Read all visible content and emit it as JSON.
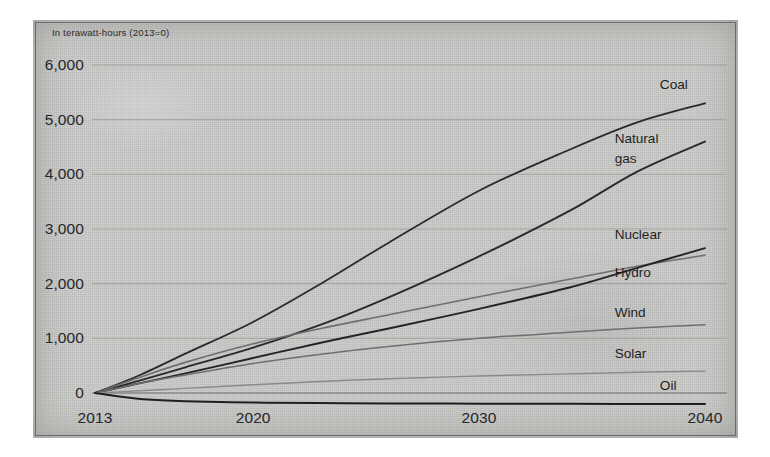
{
  "figure": {
    "subtitle": "In terawatt-hours (2013=0)",
    "background_color": "#c9c9c7",
    "paper_color": "#ffffff"
  },
  "chart_data": {
    "type": "line",
    "title": "",
    "subtitle": "In terawatt-hours (2013=0)",
    "xlabel": "",
    "ylabel": "",
    "xlim": [
      2013,
      2040
    ],
    "ylim": [
      -400,
      6400
    ],
    "grid": true,
    "gridlines_y": [
      0,
      1000,
      2000,
      3000,
      4000,
      5000,
      6000
    ],
    "legend_position": "right-inline-labels",
    "x_tick_labels": [
      "2013",
      "2020",
      "2030",
      "2040"
    ],
    "x_ticks": [
      2013,
      2020,
      2030,
      2040
    ],
    "y_tick_labels": [
      "0",
      "1,000",
      "2,000",
      "3,000",
      "4,000",
      "5,000",
      "6,000"
    ],
    "y_ticks": [
      0,
      1000,
      2000,
      3000,
      4000,
      5000,
      6000
    ],
    "x": [
      2013,
      2015,
      2017,
      2020,
      2023,
      2026,
      2030,
      2034,
      2037,
      2040
    ],
    "series": [
      {
        "name": "Coal",
        "color": "#2a2a2e",
        "width": 1.8,
        "values": [
          0,
          330,
          720,
          1300,
          2000,
          2750,
          3700,
          4450,
          4950,
          5300
        ]
      },
      {
        "name": "Natural gas",
        "color": "#2a2a2e",
        "width": 1.9,
        "values": [
          0,
          230,
          470,
          830,
          1250,
          1750,
          2500,
          3330,
          4050,
          4600
        ]
      },
      {
        "name": "Nuclear",
        "color": "#6f6f70",
        "width": 1.6,
        "values": [
          0,
          290,
          560,
          900,
          1180,
          1430,
          1760,
          2080,
          2320,
          2520
        ]
      },
      {
        "name": "Hydro",
        "color": "#242428",
        "width": 1.9,
        "values": [
          0,
          180,
          360,
          640,
          920,
          1180,
          1540,
          1930,
          2290,
          2650
        ]
      },
      {
        "name": "Wind",
        "color": "#6f6f70",
        "width": 1.5,
        "values": [
          0,
          180,
          330,
          540,
          710,
          850,
          1000,
          1110,
          1190,
          1250
        ]
      },
      {
        "name": "Solar",
        "color": "#8a8a8b",
        "width": 1.4,
        "values": [
          0,
          40,
          85,
          150,
          210,
          260,
          310,
          350,
          380,
          400
        ]
      },
      {
        "name": "Oil",
        "color": "#1f1f23",
        "width": 2.0,
        "values": [
          0,
          -110,
          -150,
          -175,
          -185,
          -190,
          -195,
          -198,
          -200,
          -200
        ]
      }
    ],
    "annotations": [
      {
        "text": "Coal",
        "x": 2038,
        "y": 5620
      },
      {
        "text": "Natural",
        "x": 2036,
        "y": 4620
      },
      {
        "text": "gas",
        "x": 2036,
        "y": 4260
      },
      {
        "text": "Nuclear",
        "x": 2036,
        "y": 2880
      },
      {
        "text": "Hydro",
        "x": 2036,
        "y": 2180
      },
      {
        "text": "Wind",
        "x": 2036,
        "y": 1450
      },
      {
        "text": "Solar",
        "x": 2036,
        "y": 700
      },
      {
        "text": "Oil",
        "x": 2038,
        "y": 110
      }
    ]
  }
}
